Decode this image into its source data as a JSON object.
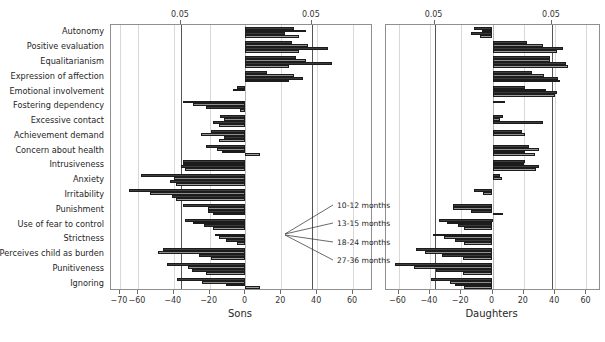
{
  "chart_data": {
    "type": "bar",
    "orientation": "horizontal",
    "title": "",
    "categories": [
      "Autonomy",
      "Positive evaluation",
      "Equalitarianism",
      "Expression of affection",
      "Emotional involvement",
      "Fostering dependency",
      "Excessive contact",
      "Achievement demand",
      "Concern about health",
      "Intrusiveness",
      "Anxiety",
      "Irritability",
      "Punishment",
      "Use of fear to control",
      "Strictness",
      "Perceives child as burden",
      "Punitiveness",
      "Ignoring"
    ],
    "series": [
      {
        "name": "10-12 months"
      },
      {
        "name": "13-15 months"
      },
      {
        "name": "18-24 months"
      },
      {
        "name": "27-36 months"
      }
    ],
    "panels": [
      {
        "key": "sons",
        "xlabel": "Sons",
        "xlim": [
          -75,
          70
        ],
        "xticks": [
          -70,
          -60,
          -40,
          -20,
          0,
          20,
          40,
          60
        ],
        "xtick_labels": [
          "−70",
          "−60",
          "−40",
          "−20",
          "0",
          "20",
          "40",
          "60"
        ],
        "gridlines": [
          -70,
          -60,
          -40,
          -20,
          0,
          20,
          40,
          60
        ],
        "significance_lines": [
          -36,
          37
        ],
        "significance_labels": [
          "0.05",
          "0.05"
        ],
        "values": [
          {
            "category": "Autonomy",
            "bars": [
              27,
              34,
              22,
              30
            ]
          },
          {
            "category": "Positive evaluation",
            "bars": [
              26,
              35,
              46,
              30
            ]
          },
          {
            "category": "Equalitarianism",
            "bars": [
              28,
              34,
              48,
              24
            ]
          },
          {
            "category": "Expression of affection",
            "bars": [
              12,
              27,
              32,
              24
            ]
          },
          {
            "category": "Emotional involvement",
            "bars": [
              -5,
              -7,
              0,
              0
            ]
          },
          {
            "category": "Fostering dependency",
            "bars": [
              -35,
              -29,
              -22,
              -3
            ]
          },
          {
            "category": "Excessive contact",
            "bars": [
              -14,
              -12,
              -18,
              -15
            ]
          },
          {
            "category": "Achievement demand",
            "bars": [
              -19,
              -25,
              -12,
              -15
            ]
          },
          {
            "category": "Concern about health",
            "bars": [
              -22,
              -16,
              -13,
              8
            ]
          },
          {
            "category": "Intrusiveness",
            "bars": [
              -35,
              -35,
              -36,
              -34
            ]
          },
          {
            "category": "Anxiety",
            "bars": [
              -58,
              -40,
              -42,
              -39
            ]
          },
          {
            "category": "Irritability",
            "bars": [
              -65,
              -53,
              -41,
              -39
            ]
          },
          {
            "category": "Punishment",
            "bars": [
              -35,
              -21,
              -21,
              -18
            ]
          },
          {
            "category": "Use of fear to control",
            "bars": [
              -34,
              -29,
              -23,
              -18
            ]
          },
          {
            "category": "Strictness",
            "bars": [
              -17,
              -15,
              -11,
              -5
            ]
          },
          {
            "category": "Perceives child as burden",
            "bars": [
              -46,
              -49,
              -26,
              -19
            ]
          },
          {
            "category": "Punitiveness",
            "bars": [
              -44,
              -32,
              -30,
              -22
            ]
          },
          {
            "category": "Ignoring",
            "bars": [
              -38,
              -24,
              -11,
              8
            ]
          }
        ]
      },
      {
        "key": "daughters",
        "xlabel": "Daughters",
        "xlim": [
          -68,
          68
        ],
        "xticks": [
          -60,
          -40,
          -20,
          0,
          20,
          40,
          60
        ],
        "xtick_labels": [
          "−60",
          "−40",
          "−20",
          "0",
          "20",
          "40",
          "60"
        ],
        "gridlines": [
          -60,
          -40,
          -20,
          0,
          20,
          40,
          60
        ],
        "significance_lines": [
          -37,
          38
        ],
        "significance_labels": [
          "0.05",
          "0.05"
        ],
        "values": [
          {
            "category": "Autonomy",
            "bars": [
              -12,
              -7,
              -14,
              -8
            ]
          },
          {
            "category": "Positive evaluation",
            "bars": [
              22,
              32,
              45,
              41
            ]
          },
          {
            "category": "Equalitarianism",
            "bars": [
              37,
              37,
              47,
              48
            ]
          },
          {
            "category": "Expression of affection",
            "bars": [
              25,
              33,
              42,
              43
            ]
          },
          {
            "category": "Emotional involvement",
            "bars": [
              21,
              34,
              41,
              40
            ]
          },
          {
            "category": "Concern about health",
            "bars": [
              8,
              0,
              0,
              0
            ]
          },
          {
            "category": "Fostering dependency",
            "bars": [
              7,
              5,
              32,
              0
            ]
          },
          {
            "category": "Excessive contact",
            "bars": [
              19,
              21,
              0,
              0
            ]
          },
          {
            "category": "Achievement demand",
            "bars": [
              23,
              30,
              21,
              27
            ]
          },
          {
            "category": "Concern about health 2",
            "bars": [
              21,
              20,
              30,
              28
            ]
          },
          {
            "category": "Intrusiveness",
            "bars": [
              5,
              6,
              0,
              0
            ]
          },
          {
            "category": "Anxiety",
            "bars": [
              -12,
              -6,
              0,
              0
            ]
          },
          {
            "category": "Irritability",
            "bars": [
              -25,
              -25,
              -14,
              7
            ]
          },
          {
            "category": "Punishment",
            "bars": [
              -34,
              -29,
              -22,
              -18
            ]
          },
          {
            "category": "Use of fear to control",
            "bars": [
              -38,
              -31,
              -24,
              -18
            ]
          },
          {
            "category": "Strictness",
            "bars": [
              -49,
              -43,
              -32,
              -19
            ]
          },
          {
            "category": "Perceives child as burden",
            "bars": [
              -62,
              -50,
              -36,
              -19
            ]
          },
          {
            "category": "Punitiveness",
            "bars": [
              -39,
              -27,
              -24,
              -18
            ]
          },
          {
            "category": "Ignoring",
            "bars": [
              -34,
              -26,
              -16,
              4
            ]
          }
        ]
      }
    ],
    "legend": {
      "position": "center-right-inset",
      "entries": [
        "10-12 months",
        "13-15 months",
        "18-24 months",
        "27-36 months"
      ]
    },
    "colors": {
      "bar_fill_dark": "#3a3a3a",
      "bar_fill_light": "#9a9a9a",
      "bar_edge": "#1c1c1c",
      "grid": "#d8d8d8",
      "significance_line": "#555555",
      "axis": "#8f8f8f",
      "text": "#262626",
      "background": "#ffffff"
    },
    "grid": true
  }
}
